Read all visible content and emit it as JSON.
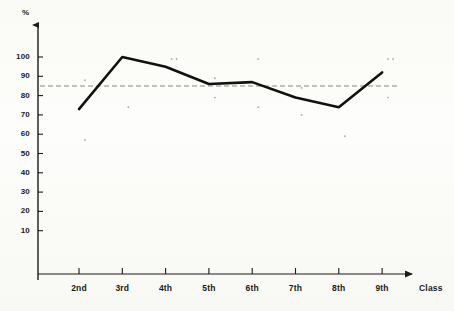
{
  "chart_data": {
    "type": "line",
    "title": "",
    "subtitle": "",
    "xlabel": "Class",
    "ylabel": "%",
    "categories": [
      "2nd",
      "3rd",
      "4th",
      "5th",
      "6th",
      "7th",
      "8th",
      "9th"
    ],
    "series": [
      {
        "name": "Percentage",
        "values": [
          73,
          100,
          95,
          86,
          87,
          79,
          74,
          92
        ]
      }
    ],
    "ylim": [
      0,
      110
    ],
    "yticks": [
      10,
      20,
      30,
      40,
      50,
      60,
      70,
      80,
      90,
      100
    ],
    "ytick_labels": [
      "10",
      "20",
      "30",
      "40",
      "50",
      "60",
      "70",
      "80",
      "90",
      "100"
    ],
    "grid": false,
    "legend": "none",
    "reference_line": {
      "value": 85,
      "style": "dashed",
      "color": "#888888",
      "label": ""
    },
    "scatter_marks": [
      {
        "class": "2nd",
        "value": 88
      },
      {
        "class": "2nd",
        "value": 57
      },
      {
        "class": "3rd",
        "value": 74
      },
      {
        "class": "4th",
        "value": 99
      },
      {
        "class": "4th",
        "value": 99
      },
      {
        "class": "5th",
        "value": 89
      },
      {
        "class": "5th",
        "value": 79
      },
      {
        "class": "6th",
        "value": 99
      },
      {
        "class": "6th",
        "value": 74
      },
      {
        "class": "7th",
        "value": 84
      },
      {
        "class": "7th",
        "value": 70
      },
      {
        "class": "8th",
        "value": 59
      },
      {
        "class": "9th",
        "value": 99
      },
      {
        "class": "9th",
        "value": 99
      },
      {
        "class": "9th",
        "value": 79
      }
    ],
    "colors": {
      "line": "#111111",
      "axis": "#1a1a1a",
      "reference": "#8a8a8a",
      "background": "#fdfdfb"
    }
  },
  "axes": {
    "y_title": "%",
    "x_title": "Class"
  }
}
